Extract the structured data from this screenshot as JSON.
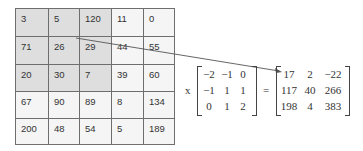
{
  "image_matrix": {
    "rows": [
      [
        "3",
        "5",
        "120",
        "11",
        "0"
      ],
      [
        "71",
        "26",
        "29",
        "44",
        "55"
      ],
      [
        "20",
        "30",
        "7",
        "39",
        "60"
      ],
      [
        "67",
        "90",
        "89",
        "8",
        "134"
      ],
      [
        "200",
        "48",
        "54",
        "5",
        "189"
      ]
    ],
    "highlight": "top-left 3x3",
    "highlight_color": "#dedede"
  },
  "equation": {
    "times_symbol": "x",
    "equals_symbol": "=",
    "kernel": [
      [
        "−2",
        "−1",
        "0"
      ],
      [
        "−1",
        "1",
        "1"
      ],
      [
        "0",
        "1",
        "2"
      ]
    ],
    "result": [
      [
        "17",
        "2",
        "−22"
      ],
      [
        "117",
        "40",
        "266"
      ],
      [
        "198",
        "4",
        "383"
      ]
    ]
  }
}
